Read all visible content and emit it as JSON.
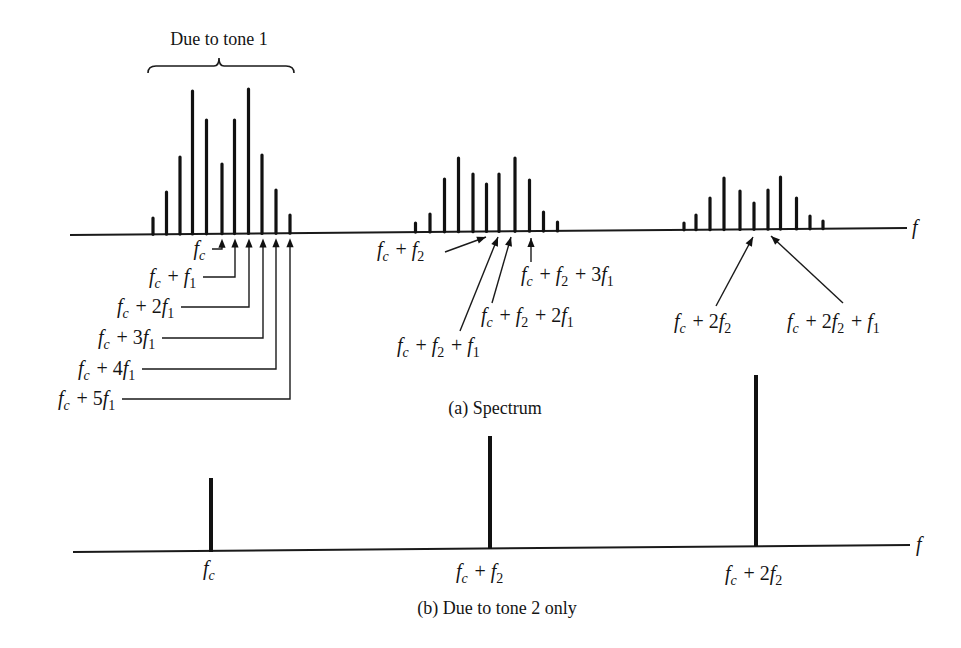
{
  "figure": {
    "title_a": "(a) Spectrum",
    "title_b": "(b) Due to tone 2 only",
    "brace_label": "Due to tone 1",
    "axis_label": "f"
  },
  "chart_data": [
    {
      "type": "bar",
      "title": "(a) Spectrum",
      "xlabel": "f",
      "ylabel": "",
      "annotation": "Due to tone 1",
      "grid": false,
      "clusters": [
        {
          "name": "Cluster around f_c",
          "center_label": "f_c",
          "lines": [
            {
              "x": 153,
              "top": 218
            },
            {
              "x": 166.5,
              "top": 192
            },
            {
              "x": 180,
              "top": 157
            },
            {
              "x": 192.5,
              "top": 91
            },
            {
              "x": 206.5,
              "top": 120
            },
            {
              "x": 222,
              "top": 164
            },
            {
              "x": 234.5,
              "top": 120
            },
            {
              "x": 248.5,
              "top": 89
            },
            {
              "x": 262,
              "top": 155
            },
            {
              "x": 276,
              "top": 190
            },
            {
              "x": 290,
              "top": 215
            }
          ],
          "relative_heights": [
            0.12,
            0.3,
            0.54,
            1.0,
            0.8,
            0.49,
            0.8,
            1.0,
            0.55,
            0.31,
            0.14
          ]
        },
        {
          "name": "Cluster around f_c + f_2",
          "center_label": "f_c + f_2",
          "lines": [
            {
              "x": 415.5,
              "top": 223
            },
            {
              "x": 430,
              "top": 214
            },
            {
              "x": 444.5,
              "top": 179
            },
            {
              "x": 458.5,
              "top": 158
            },
            {
              "x": 473,
              "top": 174
            },
            {
              "x": 486.5,
              "top": 184
            },
            {
              "x": 499,
              "top": 174
            },
            {
              "x": 515,
              "top": 158
            },
            {
              "x": 529.5,
              "top": 180
            },
            {
              "x": 543.5,
              "top": 212
            },
            {
              "x": 557.5,
              "top": 222
            }
          ],
          "relative_heights": [
            0.08,
            0.2,
            0.7,
            1.0,
            0.78,
            0.65,
            0.78,
            1.0,
            0.69,
            0.24,
            0.1
          ]
        },
        {
          "name": "Cluster around f_c + 2f_2",
          "center_label": "f_c + 2f_2",
          "lines": [
            {
              "x": 684,
              "top": 223
            },
            {
              "x": 696,
              "top": 215
            },
            {
              "x": 710,
              "top": 198
            },
            {
              "x": 724,
              "top": 178
            },
            {
              "x": 740,
              "top": 191
            },
            {
              "x": 754,
              "top": 203
            },
            {
              "x": 768,
              "top": 190
            },
            {
              "x": 780.5,
              "top": 177
            },
            {
              "x": 796.5,
              "top": 198
            },
            {
              "x": 810,
              "top": 216
            },
            {
              "x": 823,
              "top": 221
            }
          ],
          "relative_heights": [
            0.09,
            0.25,
            0.6,
            1.0,
            0.76,
            0.53,
            0.78,
            1.0,
            0.62,
            0.24,
            0.14
          ]
        }
      ],
      "labels": [
        "f_c",
        "f_c + f_1",
        "f_c + 2f_1",
        "f_c + 3f_1",
        "f_c + 4f_1",
        "f_c + 5f_1",
        "f_c + f_2",
        "f_c + f_2 + f_1",
        "f_c + f_2 + 2f_1",
        "f_c + f_2 + 3f_1",
        "f_c + 2f_2",
        "f_c + 2f_2 + f_1"
      ]
    },
    {
      "type": "bar",
      "title": "(b) Due to tone 2 only",
      "xlabel": "f",
      "ylabel": "",
      "grid": false,
      "categories": [
        "f_c",
        "f_c + f_2",
        "f_c + 2f_2"
      ],
      "values": [
        0.43,
        0.66,
        1.0
      ],
      "lines": [
        {
          "x": 211,
          "top": 478,
          "base": 552
        },
        {
          "x": 490,
          "top": 436,
          "base": 549
        },
        {
          "x": 756,
          "top": 375,
          "base": 546
        }
      ]
    }
  ],
  "annotations_a": {
    "tone1": [
      {
        "label": "f_c",
        "target_x": 222,
        "leader_y": 255,
        "text_right": 207
      },
      {
        "label": "f_c + f_1",
        "target_x": 235,
        "leader_y": 283,
        "text_right": 198
      },
      {
        "label": "f_c + 2f_1",
        "target_x": 249,
        "leader_y": 313,
        "text_right": 176
      },
      {
        "label": "f_c + 3f_1",
        "target_x": 263,
        "leader_y": 344,
        "text_right": 157
      },
      {
        "label": "f_c + 4f_1",
        "target_x": 276,
        "leader_y": 375,
        "text_right": 137
      },
      {
        "label": "f_c + 5f_1",
        "target_x": 290,
        "leader_y": 405,
        "text_right": 117
      }
    ],
    "tone2": [
      {
        "label": "f_c + f_2",
        "text_x": 377,
        "text_y": 256,
        "from": [
          445,
          252
        ],
        "to": [
          486,
          237
        ]
      },
      {
        "label": "f_c + f_2 + f_1",
        "text_x": 397,
        "text_y": 352,
        "from": [
          460,
          331
        ],
        "to": [
          498,
          237
        ]
      },
      {
        "label": "f_c + f_2 + 2f_1",
        "text_x": 481,
        "text_y": 322,
        "from": [
          492,
          303
        ],
        "to": [
          511,
          237
        ]
      },
      {
        "label": "f_c + f_2 + 3f_1",
        "text_x": 521,
        "text_y": 281,
        "from": [
          531,
          262
        ],
        "to": [
          531,
          238
        ]
      },
      {
        "label": "f_c + 2f_2",
        "text_x": 674,
        "text_y": 328,
        "from": [
          716,
          306
        ],
        "to": [
          753,
          237
        ]
      },
      {
        "label": "f_c + 2f_2 + f_1",
        "text_x": 787,
        "text_y": 328,
        "from": [
          843,
          303
        ],
        "to": [
          771,
          236
        ]
      }
    ]
  },
  "labels_b": [
    {
      "label": "f_c",
      "x": 203,
      "y": 575
    },
    {
      "label": "f_c + f_2",
      "x": 456,
      "y": 578
    },
    {
      "label": "f_c + 2f_2",
      "x": 725,
      "y": 580
    }
  ],
  "layout": {
    "axis_a": {
      "x1": 70,
      "y1": 235,
      "x2": 907,
      "y2": 228
    },
    "axis_b": {
      "x1": 73,
      "y1": 552,
      "x2": 910,
      "y2": 545
    },
    "axis_label_a": {
      "x": 912,
      "y": 234
    },
    "axis_label_b": {
      "x": 916,
      "y": 551
    },
    "brace": {
      "x1": 148,
      "x2": 294,
      "y": 66,
      "mid": 219
    },
    "brace_label_pos": {
      "x": 219,
      "y": 45
    },
    "caption_a_pos": {
      "x": 495,
      "y": 414
    },
    "caption_b_pos": {
      "x": 497,
      "y": 614
    }
  }
}
